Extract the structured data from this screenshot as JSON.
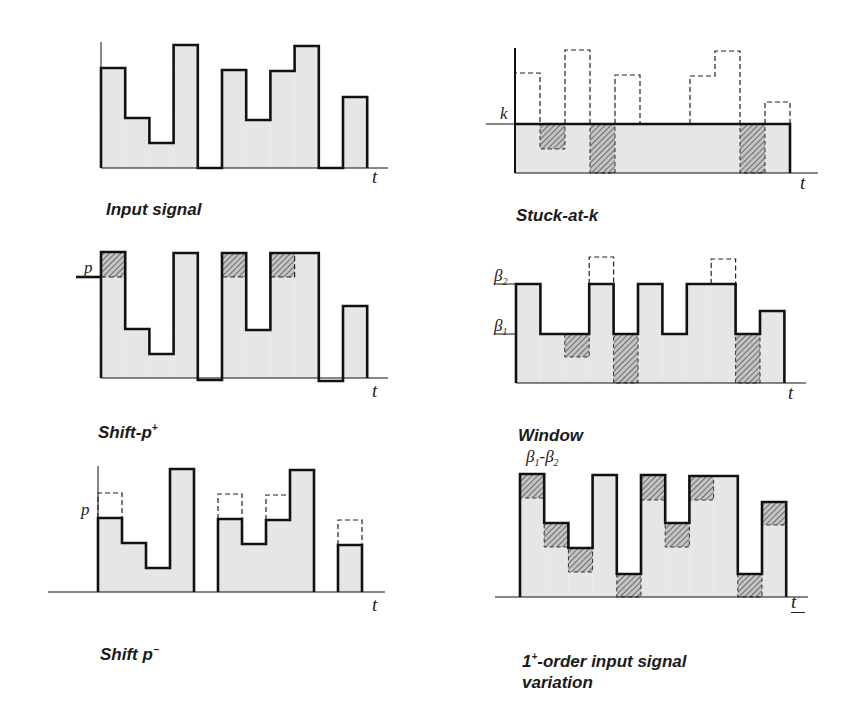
{
  "figure": {
    "panels": [
      {
        "id": "input-signal",
        "caption": "Input signal",
        "t_label": "t",
        "axis_x": 101,
        "baseline": 168,
        "axis_top": 42,
        "axis_end": 388,
        "bar_width": 24.2,
        "bars": [
          68,
          118,
          143,
          45,
          168,
          70,
          120,
          71,
          46,
          168,
          97
        ],
        "caption_pos": [
          106,
          187
        ],
        "t_pos": [
          372,
          178
        ]
      },
      {
        "id": "stuck-at-k",
        "caption": "Stuck-at-k",
        "t_label": "t",
        "y_labels": [
          {
            "text": "k",
            "y": 124
          }
        ],
        "axis_x": 515,
        "baseline": 173,
        "axis_top": 48,
        "axis_end": 818,
        "k_level": 124,
        "bar_width": 25,
        "original": [
          73,
          149,
          50,
          173,
          75,
          173,
          76,
          51,
          173,
          102
        ],
        "caption_pos": [
          516,
          193
        ],
        "t_pos": [
          800,
          184
        ]
      },
      {
        "id": "shift-p-plus",
        "caption": "Shift-p",
        "caption_sup": "+",
        "t_label": "t",
        "y_labels": [
          {
            "text": "p",
            "y": 277
          }
        ],
        "axis_x": 101,
        "baseline": 378,
        "axis_top": 252,
        "axis_end": 388,
        "p_level": 277,
        "bar_width": 24.2,
        "bars": [
          252,
          329,
          354,
          253,
          380,
          253,
          330,
          253,
          253,
          381,
          306
        ],
        "caption_pos": [
          98,
          404
        ],
        "t_pos": [
          372,
          394
        ]
      },
      {
        "id": "window-beta",
        "caption": "Window",
        "caption_math": "β1-β2",
        "t_label": "t",
        "y_labels": [
          {
            "text": "β2",
            "y": 284
          },
          {
            "text": "β1",
            "y": 334
          }
        ],
        "axis_x": 516,
        "baseline": 383,
        "axis_end": 806,
        "beta2": 284,
        "beta1": 334,
        "bar_width": 24.4,
        "original": [
          284,
          334,
          357,
          257,
          383,
          284,
          334,
          284,
          259,
          383,
          311
        ],
        "caption_pos": [
          518,
          412
        ],
        "t_pos": [
          788,
          392
        ]
      },
      {
        "id": "shift-p-minus",
        "caption": "Shift p",
        "caption_sup": "−",
        "t_label": "t",
        "y_labels": [
          {
            "text": "p",
            "y": 510
          }
        ],
        "axis_x": 98,
        "baseline": 592,
        "axis_top": 466,
        "axis_start": 48,
        "axis_end": 385,
        "bar_width": 24,
        "bars": [
          518,
          543,
          568,
          469,
          null,
          519,
          544,
          520,
          470,
          null,
          545
        ],
        "original": [
          493,
          543,
          568,
          469,
          null,
          494,
          544,
          495,
          470,
          null,
          520
        ],
        "caption_pos": [
          100,
          626
        ],
        "t_pos": [
          372,
          602
        ]
      },
      {
        "id": "first-order-variation",
        "caption": "1+-order input signal\nvariation",
        "caption_sup": "+",
        "t_label": "t",
        "axis_x": 520,
        "baseline": 597,
        "axis_start": 495,
        "axis_end": 808,
        "bar_width": 24.2,
        "bars": [
          474,
          523,
          548,
          475,
          574,
          475,
          523,
          476,
          476,
          574,
          502
        ],
        "shaded_to": [
          498,
          547,
          572,
          null,
          597,
          500,
          547,
          500,
          null,
          597,
          525
        ],
        "caption_pos": [
          522,
          633
        ],
        "t_pos": [
          790,
          602
        ]
      }
    ]
  },
  "colors": {
    "fill": "#e6e6e6",
    "stroke": "#111111",
    "hatch": "#666666",
    "hatch_bg": "#bdbdbd"
  }
}
